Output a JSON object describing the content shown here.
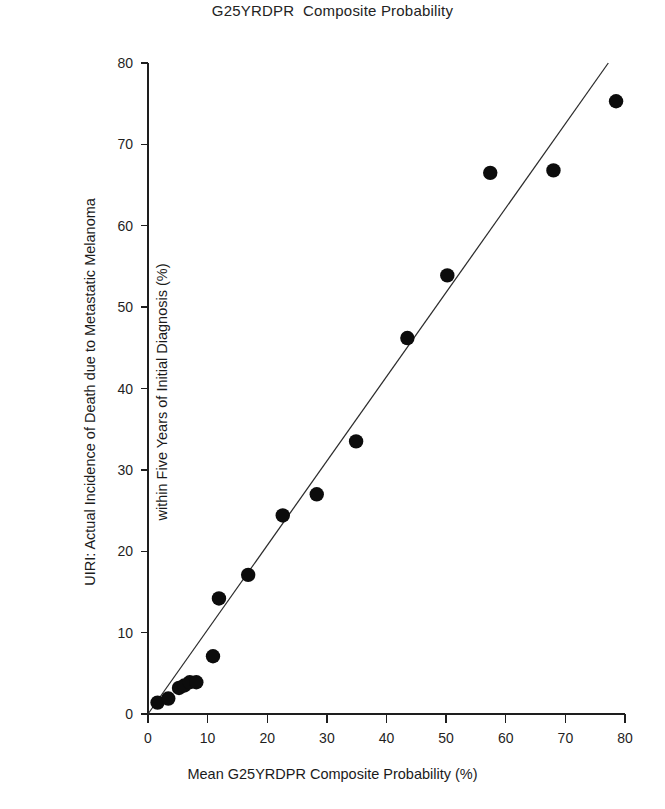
{
  "figure": {
    "title": "G25YRDPR  Composite Probability",
    "clipped_title_above": "G25YRDPR  Composite Probability"
  },
  "chart_data": {
    "type": "scatter",
    "title": "G25YRDPR  Composite Probability",
    "xlabel": "Mean G25YRDPR Composite Probability (%)",
    "ylabel": "UIRI: Actual Incidence of Death due to Metastatic Melanoma within Five Years of Initial Diagnosis (%)",
    "xlim": [
      0,
      80
    ],
    "ylim": [
      0,
      80
    ],
    "xticks": [
      0,
      10,
      20,
      30,
      40,
      50,
      60,
      70,
      80
    ],
    "yticks": [
      0,
      10,
      20,
      30,
      40,
      50,
      60,
      70,
      80
    ],
    "xticklabels": [
      "0",
      "10",
      "20",
      "30",
      "40",
      "50",
      "60",
      "70",
      "80"
    ],
    "yticklabels": [
      "0",
      "10",
      "20",
      "30",
      "40",
      "50",
      "60",
      "70",
      "80"
    ],
    "grid": false,
    "legend": null,
    "marker": "filled-circle",
    "marker_color": "#0c0c0c",
    "points": [
      {
        "x": 1.6,
        "y": 1.4
      },
      {
        "x": 3.4,
        "y": 1.9
      },
      {
        "x": 5.2,
        "y": 3.2
      },
      {
        "x": 6.1,
        "y": 3.5
      },
      {
        "x": 7.0,
        "y": 3.9
      },
      {
        "x": 8.1,
        "y": 3.9
      },
      {
        "x": 10.9,
        "y": 7.1
      },
      {
        "x": 11.9,
        "y": 14.2
      },
      {
        "x": 16.8,
        "y": 17.1
      },
      {
        "x": 22.6,
        "y": 24.4
      },
      {
        "x": 28.3,
        "y": 27.0
      },
      {
        "x": 34.9,
        "y": 33.5
      },
      {
        "x": 43.5,
        "y": 46.2
      },
      {
        "x": 50.2,
        "y": 53.9
      },
      {
        "x": 57.4,
        "y": 66.5
      },
      {
        "x": 68.0,
        "y": 66.8
      },
      {
        "x": 78.5,
        "y": 75.3
      }
    ],
    "trend_line": {
      "type": "line",
      "color": "#2b2b2b",
      "x_start": 0.0,
      "y_start": 0.0,
      "x_end": 77.2,
      "y_end": 80.0
    }
  },
  "axes": {
    "x_title": "Mean G25YRDPR Composite Probability (%)",
    "y_title": "UIRI: Actual Incidence of Death due to Metastatic Melanoma\nwithin Five Years of Initial Diagnosis (%)",
    "y_title_line1": "UIRI: Actual Incidence of Death due to Metastatic Melanoma",
    "y_title_line2": "within Five Years of Initial Diagnosis (%)"
  },
  "colors": {
    "background": "#ffffff",
    "axis": "#1e1e1e",
    "marker": "#0c0c0c",
    "trend": "#2b2b2b",
    "text": "#1b1b1b"
  }
}
